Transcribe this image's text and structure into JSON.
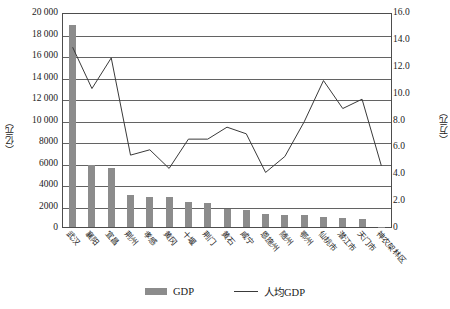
{
  "chart_data": {
    "type": "bar",
    "title": "",
    "subtitle": "",
    "xlabel": "",
    "ylabel": "（亿元）",
    "y2label": "（万元）",
    "ylim": [
      0,
      20000
    ],
    "y2lim": [
      0,
      16.0
    ],
    "grid": true,
    "legend_position": "bottom",
    "categories": [
      "武汉",
      "襄阳",
      "宜昌",
      "荆州",
      "孝感",
      "黄冈",
      "十堰",
      "荆门",
      "黄石",
      "咸宁",
      "恩施州",
      "随州",
      "鄂州",
      "仙桃市",
      "潜江市",
      "天门市",
      "神农架林区"
    ],
    "y_ticks": [
      "20 000",
      "18 000",
      "16 000",
      "14 000",
      "12 000",
      "10 000",
      "8000",
      "6000",
      "4000",
      "2000",
      "0"
    ],
    "y2_ticks": [
      "16.0",
      "14.0",
      "12.0",
      "10.0",
      "8.0",
      "6.0",
      "4.0",
      "2.0",
      "0"
    ],
    "series": [
      {
        "name": "GDP",
        "type": "bar",
        "axis": "left",
        "unit": "亿元",
        "color": "#8c8c8c",
        "values": [
          18800,
          5800,
          5500,
          3000,
          2800,
          2800,
          2300,
          2200,
          1700,
          1600,
          1200,
          1150,
          1100,
          900,
          800,
          700,
          40
        ]
      },
      {
        "name": "人均GDP",
        "type": "line",
        "axis": "right",
        "unit": "万元",
        "color": "#3a3a3a",
        "values": [
          13.5,
          10.4,
          12.7,
          5.4,
          5.8,
          4.4,
          6.6,
          6.6,
          7.5,
          7.0,
          4.1,
          5.3,
          7.9,
          11.0,
          8.9,
          9.6,
          4.6
        ]
      }
    ]
  },
  "legend": {
    "bar_label": "GDP",
    "line_label": "人均GDP"
  }
}
